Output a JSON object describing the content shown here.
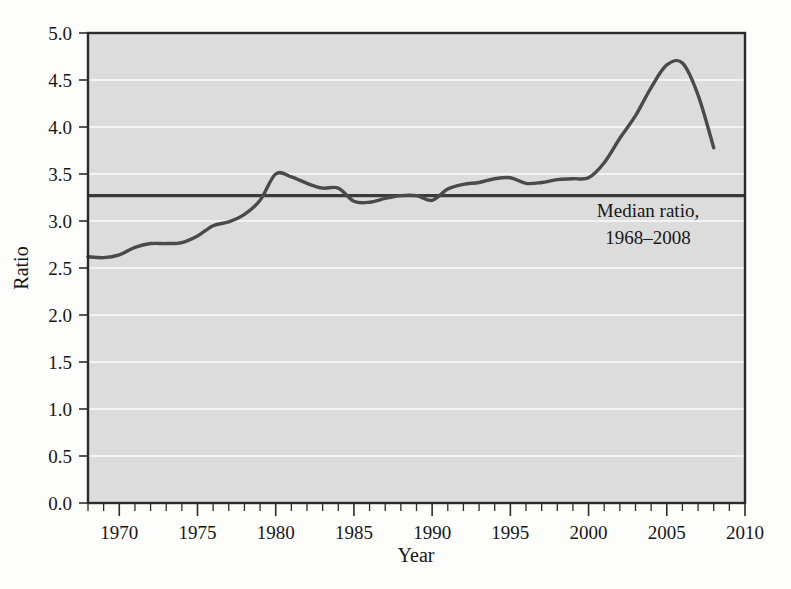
{
  "figure": {
    "background_color": "#fdfdfc",
    "plot_background_color": "#dcdcdc",
    "frame_color": "#2b2b2b",
    "gridline_color": "#f2f2f2",
    "series_color": "#4a4a4a",
    "median_line_color": "#3a3a3a"
  },
  "axes": {
    "ylabel": "Ratio",
    "xlabel": "Year",
    "y_ticks": [
      "0.0",
      "0.5",
      "1.0",
      "1.5",
      "2.0",
      "2.5",
      "3.0",
      "3.5",
      "4.0",
      "4.5",
      "5.0"
    ],
    "x_ticks": [
      "1970",
      "1975",
      "1980",
      "1985",
      "1990",
      "1995",
      "2000",
      "2005",
      "2010"
    ]
  },
  "annotation": {
    "line1": "Median ratio,",
    "line2": "1968–2008"
  },
  "chart_data": {
    "type": "line",
    "title": "",
    "xlabel": "Year",
    "ylabel": "Ratio",
    "xlim": [
      1968,
      2010
    ],
    "ylim": [
      0.0,
      5.0
    ],
    "y_ticks": [
      0.0,
      0.5,
      1.0,
      1.5,
      2.0,
      2.5,
      3.0,
      3.5,
      4.0,
      4.5,
      5.0
    ],
    "x_ticks": [
      1970,
      1975,
      1980,
      1985,
      1990,
      1995,
      2000,
      2005,
      2010
    ],
    "x_minor_tick_interval": 1,
    "grid": "horizontal",
    "legend": "none",
    "annotations": [
      {
        "text": "Median ratio, 1968–2008",
        "x": 2002.5,
        "y": 3.05,
        "kind": "reference-line-label"
      }
    ],
    "reference_lines": [
      {
        "name": "Median ratio, 1968–2008",
        "orientation": "horizontal",
        "value": 3.27
      }
    ],
    "series": [
      {
        "name": "Ratio",
        "x": [
          1968,
          1969,
          1970,
          1971,
          1972,
          1973,
          1974,
          1975,
          1976,
          1977,
          1978,
          1979,
          1980,
          1981,
          1982,
          1983,
          1984,
          1985,
          1986,
          1987,
          1988,
          1989,
          1990,
          1991,
          1992,
          1993,
          1994,
          1995,
          1996,
          1997,
          1998,
          1999,
          2000,
          2001,
          2002,
          2003,
          2004,
          2005,
          2006,
          2007,
          2008
        ],
        "values": [
          2.62,
          2.61,
          2.64,
          2.72,
          2.76,
          2.76,
          2.77,
          2.84,
          2.95,
          2.99,
          3.07,
          3.22,
          3.5,
          3.47,
          3.4,
          3.35,
          3.35,
          3.21,
          3.2,
          3.24,
          3.27,
          3.27,
          3.22,
          3.34,
          3.39,
          3.41,
          3.45,
          3.46,
          3.4,
          3.41,
          3.44,
          3.45,
          3.46,
          3.62,
          3.88,
          4.12,
          4.42,
          4.66,
          4.68,
          4.34,
          3.78
        ]
      }
    ]
  }
}
